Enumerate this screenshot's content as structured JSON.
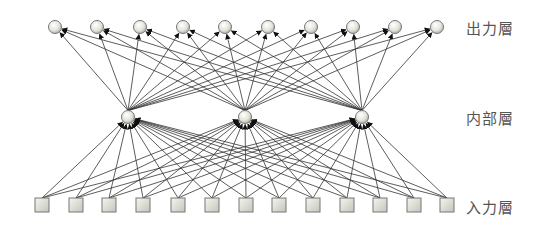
{
  "diagram": {
    "type": "neural-network",
    "labels": {
      "output": "出力層",
      "hidden": "内部層",
      "input": "入力層"
    },
    "layers": {
      "output": {
        "count": 10,
        "y": 27,
        "x": [
          55,
          97,
          140,
          183,
          225,
          268,
          311,
          353,
          395,
          437
        ],
        "shape": "circle"
      },
      "hidden": {
        "count": 3,
        "y": 117,
        "x": [
          128,
          245,
          362
        ],
        "shape": "circle"
      },
      "input": {
        "count": 13,
        "y": 205,
        "x": [
          42,
          76,
          109,
          143,
          178,
          212,
          246,
          279,
          313,
          347,
          380,
          414,
          447
        ],
        "shape": "square"
      }
    },
    "connections": "fully-connected input→hidden→output, arrows point upward",
    "colors": {
      "edge": "#333333",
      "arrowhead": "#111111",
      "node_fill_light": "#f4f4ee",
      "node_fill_dark": "#a9a99f",
      "node_stroke": "#777777",
      "label": "#555555"
    }
  }
}
